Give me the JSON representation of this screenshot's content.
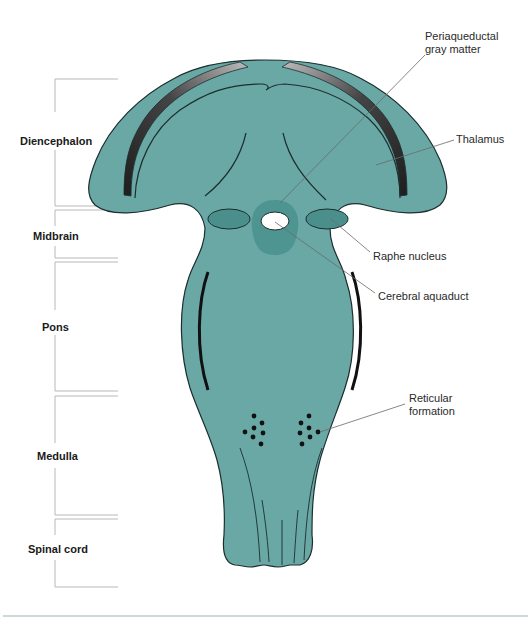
{
  "figure": {
    "colors": {
      "tissue": "#6aa8a6",
      "tissue_dark": "#4e9592",
      "nucleus": "#4a8f8b",
      "outline": "#1c2e2e",
      "band_dark": "#2a2a2a",
      "band_light": "#a0a0a0",
      "bracket": "#b8b8b8",
      "leader": "#6a6a6a",
      "bottom_rule": "#9fb3b8"
    }
  },
  "regions": [
    {
      "label": "Diencephalon"
    },
    {
      "label": "Midbrain"
    },
    {
      "label": "Pons"
    },
    {
      "label": "Medulla"
    },
    {
      "label": "Spinal cord"
    }
  ],
  "callouts": {
    "periaqueductal": {
      "line1": "Periaqueductal",
      "line2": "gray matter"
    },
    "thalamus": {
      "label": "Thalamus"
    },
    "raphe": {
      "label": "Raphe nucleus"
    },
    "aqueduct": {
      "label": "Cerebral aquaduct"
    },
    "reticular": {
      "line1": "Reticular",
      "line2": "formation"
    }
  }
}
